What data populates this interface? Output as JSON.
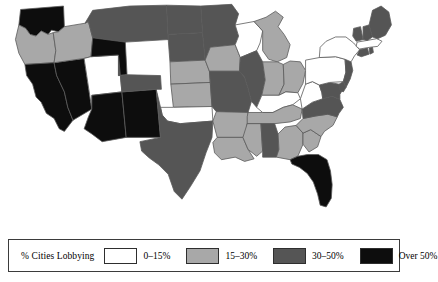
{
  "figure": {
    "title": "% Cities Lobbying",
    "map_name": "united-states-choropleth"
  },
  "legend": {
    "title": "% Cities Lobbying",
    "entries": [
      {
        "label": "0–15%",
        "color": "#ffffff",
        "key": "q1"
      },
      {
        "label": "15–30%",
        "color": "#a8a8a8",
        "key": "q2"
      },
      {
        "label": "30–50%",
        "color": "#555555",
        "key": "q3"
      },
      {
        "label": "Over 50%",
        "color": "#0d0d0d",
        "key": "q4"
      }
    ]
  },
  "chart_data": {
    "type": "map",
    "title": "% Cities Lobbying",
    "subtitle": "",
    "xlabel": "",
    "ylabel": "",
    "legend_position": "bottom",
    "grid": false,
    "bins": [
      {
        "key": "q1",
        "label": "0–15%",
        "color": "#ffffff",
        "min": 0,
        "max": 15
      },
      {
        "key": "q2",
        "label": "15–30%",
        "color": "#a8a8a8",
        "min": 15,
        "max": 30
      },
      {
        "key": "q3",
        "label": "30–50%",
        "color": "#555555",
        "min": 30,
        "max": 50
      },
      {
        "key": "q4",
        "label": "Over 50%",
        "color": "#0d0d0d",
        "min": 50,
        "max": 100
      }
    ],
    "categories": [
      "WA",
      "OR",
      "CA",
      "NV",
      "ID",
      "UT",
      "AZ",
      "NM",
      "MT",
      "WY",
      "CO",
      "ND",
      "SD",
      "NE",
      "KS",
      "OK",
      "TX",
      "MN",
      "IA",
      "MO",
      "AR",
      "LA",
      "WI",
      "IL",
      "MI",
      "IN",
      "OH",
      "KY",
      "TN",
      "MS",
      "AL",
      "GA",
      "FL",
      "SC",
      "NC",
      "VA",
      "WV",
      "MD",
      "DE",
      "PA",
      "NJ",
      "NY",
      "CT",
      "RI",
      "MA",
      "VT",
      "NH",
      "ME"
    ],
    "values": [
      "q4",
      "q2",
      "q4",
      "q4",
      "q2",
      "q1",
      "q4",
      "q4",
      "q3",
      "q4",
      "q3",
      "q3",
      "q3",
      "q2",
      "q2",
      "q1",
      "q3",
      "q3",
      "q2",
      "q3",
      "q2",
      "q2",
      "q1",
      "q3",
      "q2",
      "q2",
      "q2",
      "q1",
      "q2",
      "q2",
      "q3",
      "q2",
      "q4",
      "q2",
      "q2",
      "q3",
      "q1",
      "q3",
      "q3",
      "q1",
      "q3",
      "q1",
      "q3",
      "q3",
      "q1",
      "q3",
      "q3",
      "q3"
    ],
    "series": [
      {
        "name": "% Cities Lobbying",
        "points": [
          {
            "state": "Washington",
            "abbr": "WA",
            "bin": "q4"
          },
          {
            "state": "Oregon",
            "abbr": "OR",
            "bin": "q2"
          },
          {
            "state": "California",
            "abbr": "CA",
            "bin": "q4"
          },
          {
            "state": "Nevada",
            "abbr": "NV",
            "bin": "q4"
          },
          {
            "state": "Idaho",
            "abbr": "ID",
            "bin": "q2"
          },
          {
            "state": "Utah",
            "abbr": "UT",
            "bin": "q1"
          },
          {
            "state": "Arizona",
            "abbr": "AZ",
            "bin": "q4"
          },
          {
            "state": "New Mexico",
            "abbr": "NM",
            "bin": "q4"
          },
          {
            "state": "Montana",
            "abbr": "MT",
            "bin": "q3"
          },
          {
            "state": "Wyoming",
            "abbr": "WY",
            "bin": "q4"
          },
          {
            "state": "Colorado",
            "abbr": "CO",
            "bin": "q3"
          },
          {
            "state": "North Dakota",
            "abbr": "ND",
            "bin": "q3"
          },
          {
            "state": "South Dakota",
            "abbr": "SD",
            "bin": "q3"
          },
          {
            "state": "Nebraska",
            "abbr": "NE",
            "bin": "q2"
          },
          {
            "state": "Kansas",
            "abbr": "KS",
            "bin": "q2"
          },
          {
            "state": "Oklahoma",
            "abbr": "OK",
            "bin": "q1"
          },
          {
            "state": "Texas",
            "abbr": "TX",
            "bin": "q3"
          },
          {
            "state": "Minnesota",
            "abbr": "MN",
            "bin": "q3"
          },
          {
            "state": "Iowa",
            "abbr": "IA",
            "bin": "q2"
          },
          {
            "state": "Missouri",
            "abbr": "MO",
            "bin": "q3"
          },
          {
            "state": "Arkansas",
            "abbr": "AR",
            "bin": "q2"
          },
          {
            "state": "Louisiana",
            "abbr": "LA",
            "bin": "q2"
          },
          {
            "state": "Wisconsin",
            "abbr": "WI",
            "bin": "q1"
          },
          {
            "state": "Illinois",
            "abbr": "IL",
            "bin": "q3"
          },
          {
            "state": "Michigan",
            "abbr": "MI",
            "bin": "q2"
          },
          {
            "state": "Indiana",
            "abbr": "IN",
            "bin": "q2"
          },
          {
            "state": "Ohio",
            "abbr": "OH",
            "bin": "q2"
          },
          {
            "state": "Kentucky",
            "abbr": "KY",
            "bin": "q1"
          },
          {
            "state": "Tennessee",
            "abbr": "TN",
            "bin": "q2"
          },
          {
            "state": "Mississippi",
            "abbr": "MS",
            "bin": "q2"
          },
          {
            "state": "Alabama",
            "abbr": "AL",
            "bin": "q3"
          },
          {
            "state": "Georgia",
            "abbr": "GA",
            "bin": "q2"
          },
          {
            "state": "Florida",
            "abbr": "FL",
            "bin": "q4"
          },
          {
            "state": "South Carolina",
            "abbr": "SC",
            "bin": "q2"
          },
          {
            "state": "North Carolina",
            "abbr": "NC",
            "bin": "q2"
          },
          {
            "state": "Virginia",
            "abbr": "VA",
            "bin": "q3"
          },
          {
            "state": "West Virginia",
            "abbr": "WV",
            "bin": "q1"
          },
          {
            "state": "Maryland",
            "abbr": "MD",
            "bin": "q3"
          },
          {
            "state": "Delaware",
            "abbr": "DE",
            "bin": "q3"
          },
          {
            "state": "Pennsylvania",
            "abbr": "PA",
            "bin": "q1"
          },
          {
            "state": "New Jersey",
            "abbr": "NJ",
            "bin": "q3"
          },
          {
            "state": "New York",
            "abbr": "NY",
            "bin": "q1"
          },
          {
            "state": "Connecticut",
            "abbr": "CT",
            "bin": "q3"
          },
          {
            "state": "Rhode Island",
            "abbr": "RI",
            "bin": "q3"
          },
          {
            "state": "Massachusetts",
            "abbr": "MA",
            "bin": "q1"
          },
          {
            "state": "Vermont",
            "abbr": "VT",
            "bin": "q3"
          },
          {
            "state": "New Hampshire",
            "abbr": "NH",
            "bin": "q3"
          },
          {
            "state": "Maine",
            "abbr": "ME",
            "bin": "q3"
          }
        ]
      }
    ]
  }
}
